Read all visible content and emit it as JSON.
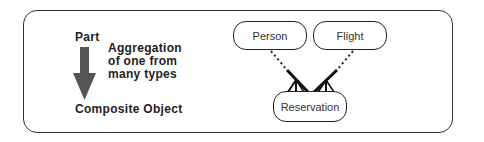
{
  "legend": {
    "top_label": "Part",
    "bottom_label": "Composite Object",
    "description_lines": [
      "Aggregation",
      "of one from",
      "many types"
    ],
    "arrow": "down-arrow-icon"
  },
  "diagram": {
    "nodes": [
      {
        "id": "person",
        "label": "Person"
      },
      {
        "id": "flight",
        "label": "Flight"
      },
      {
        "id": "reservation",
        "label": "Reservation"
      }
    ],
    "edges": [
      {
        "from": "person",
        "to": "reservation",
        "type": "aggregation"
      },
      {
        "from": "flight",
        "to": "reservation",
        "type": "aggregation"
      }
    ]
  },
  "colors": {
    "stroke": "#222222",
    "arrow": "#555555",
    "background": "#ffffff"
  }
}
